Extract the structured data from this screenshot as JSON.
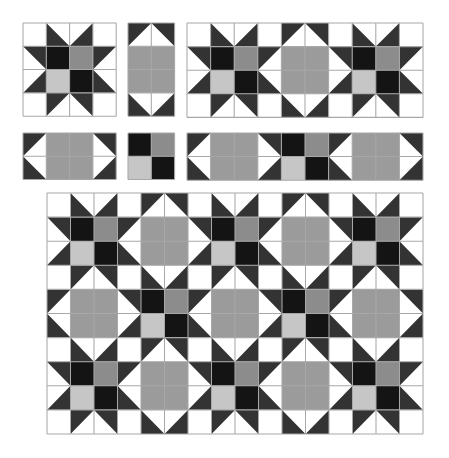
{
  "colors": {
    "background": "#ffffff",
    "white": "#ffffff",
    "star_point": "#333333",
    "black": "#141414",
    "mid_gray": "#8c8c8c",
    "light_gray": "#c6c6c6",
    "sash_gray": "#9b9b9b",
    "seam_line": "#a8a8a8"
  },
  "block_types": {
    "star": {
      "cols": 4,
      "rows": 4,
      "name": "Star block"
    },
    "vsash": {
      "cols": 2,
      "rows": 4,
      "name": "Vertical sashing block"
    },
    "hsash": {
      "cols": 4,
      "rows": 2,
      "name": "Horizontal sashing block"
    },
    "corner": {
      "cols": 2,
      "rows": 2,
      "name": "Four-patch cornerstone"
    }
  },
  "panels": [
    {
      "id": "single-star",
      "label": "Single star block",
      "x": 23,
      "y": 23,
      "cell": 23.3,
      "layout": [
        [
          "star"
        ]
      ]
    },
    {
      "id": "single-vsash",
      "label": "Single vertical sashing",
      "x": 128,
      "y": 23,
      "cell": 23.3,
      "layout": [
        [
          "vsash"
        ]
      ]
    },
    {
      "id": "star-row-strip",
      "label": "Star row strip",
      "x": 187,
      "y": 23,
      "cell": 23.6,
      "layout": [
        [
          "star",
          "vsash",
          "star"
        ]
      ]
    },
    {
      "id": "single-hsash",
      "label": "Single horizontal sashing",
      "x": 23,
      "y": 133,
      "cell": 23.3,
      "layout": [
        [
          "hsash"
        ]
      ]
    },
    {
      "id": "single-corner",
      "label": "Single cornerstone",
      "x": 128,
      "y": 133,
      "cell": 23.3,
      "layout": [
        [
          "corner"
        ]
      ]
    },
    {
      "id": "sash-row-strip",
      "label": "Sashing row strip",
      "x": 187,
      "y": 133,
      "cell": 23.6,
      "layout": [
        [
          "hsash",
          "corner",
          "hsash"
        ]
      ]
    },
    {
      "id": "quilt-top",
      "label": "Assembled quilt top",
      "x": 47,
      "y": 193,
      "cell": 23.5,
      "cellY": 24.1,
      "layout": [
        [
          "star",
          "vsash",
          "star",
          "vsash",
          "star"
        ],
        [
          "hsash",
          "corner",
          "hsash",
          "corner",
          "hsash"
        ],
        [
          "star",
          "vsash",
          "star",
          "vsash",
          "star"
        ]
      ]
    }
  ]
}
